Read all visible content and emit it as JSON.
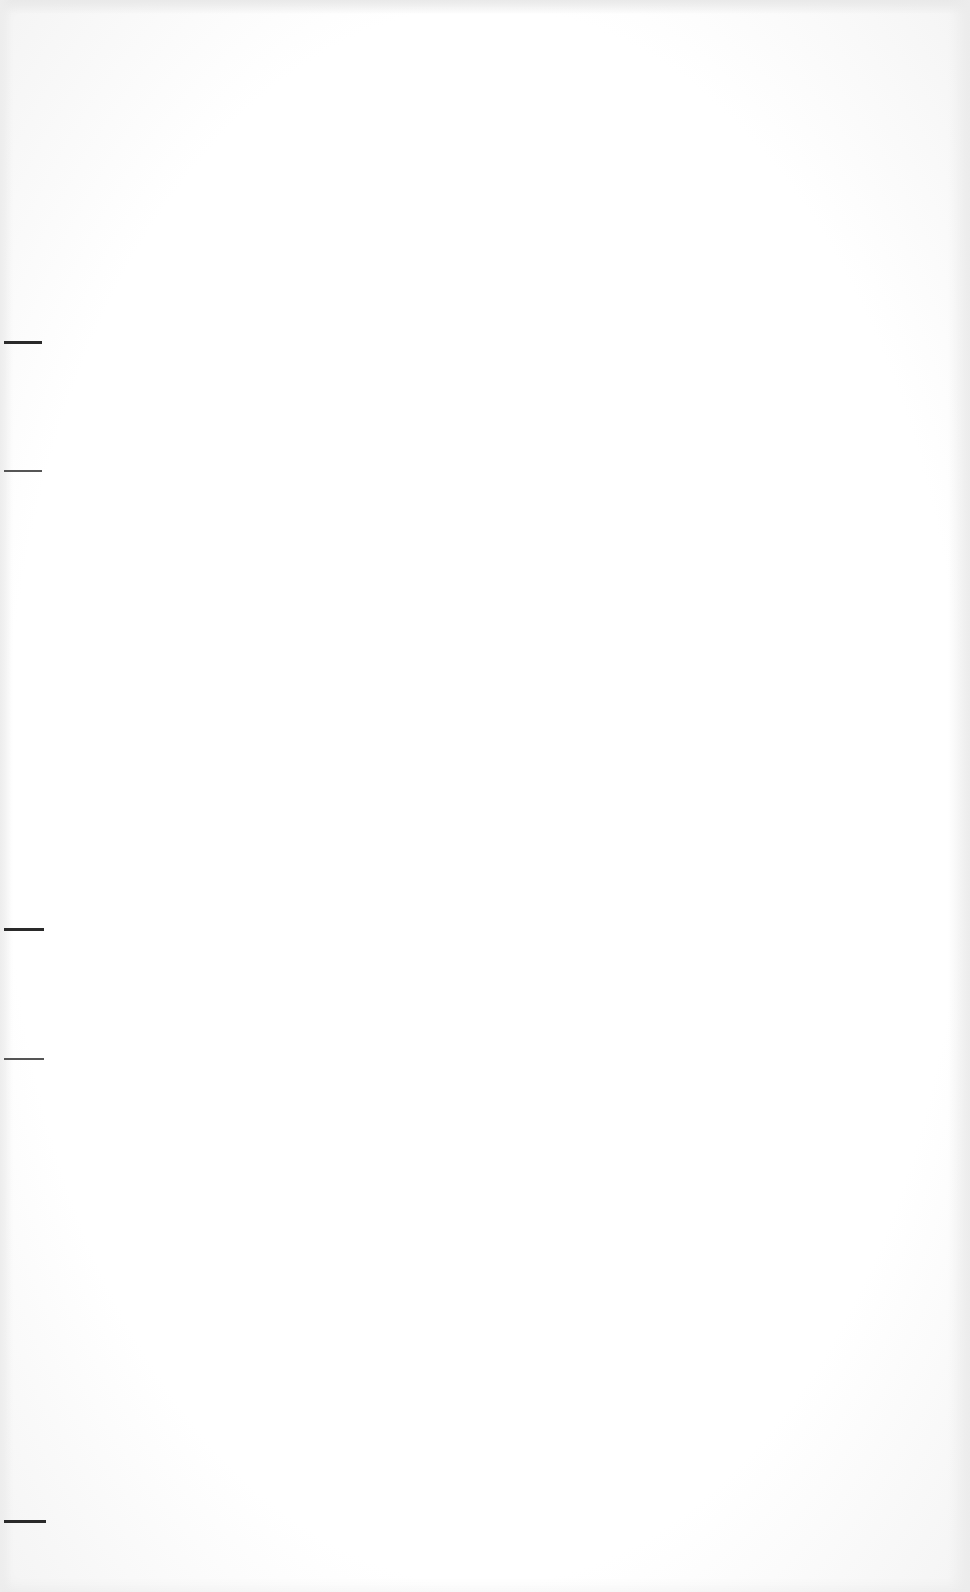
{
  "document": {
    "type": "blank scanned page",
    "background_color": "#ffffff",
    "margin_marks": [
      {
        "y": 341,
        "width": 38,
        "weight": "thick"
      },
      {
        "y": 470,
        "width": 38,
        "weight": "thin"
      },
      {
        "y": 928,
        "width": 40,
        "weight": "thick"
      },
      {
        "y": 1058,
        "width": 40,
        "weight": "thin"
      },
      {
        "y": 1520,
        "width": 42,
        "weight": "thick"
      }
    ]
  }
}
